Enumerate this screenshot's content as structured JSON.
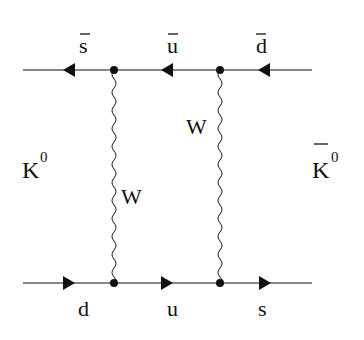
{
  "diagram": {
    "type": "feynman",
    "colors": {
      "ink": "#111111",
      "background": "#ffffff"
    },
    "initial_state": {
      "label": "K",
      "superscript": "0",
      "bar": false
    },
    "final_state": {
      "label": "K",
      "superscript": "0",
      "bar": true
    },
    "top_line": {
      "direction": "left",
      "quarks": [
        {
          "label": "s",
          "bar": true
        },
        {
          "label": "u",
          "bar": true
        },
        {
          "label": "d",
          "bar": true
        }
      ]
    },
    "bottom_line": {
      "direction": "right",
      "quarks": [
        {
          "label": "d",
          "bar": false
        },
        {
          "label": "u",
          "bar": false
        },
        {
          "label": "s",
          "bar": false
        }
      ]
    },
    "bosons": [
      {
        "label": "W",
        "position": "left"
      },
      {
        "label": "W",
        "position": "right"
      }
    ],
    "vertices": 4
  }
}
